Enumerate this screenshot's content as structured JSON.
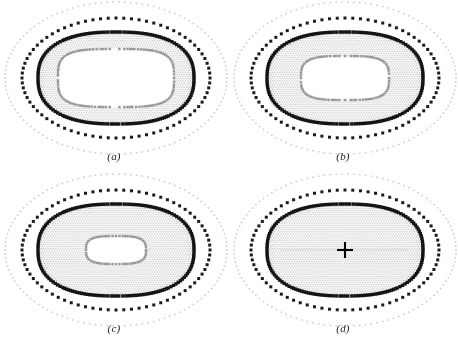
{
  "figure": {
    "type": "mesh-diagram",
    "background_color": "#ffffff",
    "width": 458,
    "height": 345
  },
  "style": {
    "boundary_node_color": "#141414",
    "interior_mesh_color": "#9a9a9a",
    "interior_mesh_light_color": "#c8c8c8",
    "outer_ring_color": "#c9c9c9",
    "mid_ring_color": "#1b1b1b",
    "marker_color": "#000000",
    "label_color": "#1c1c1c",
    "boundary_node_size": 1.7,
    "mid_ring_dot_size": 1.5,
    "outer_ring_dot_size": 0.75
  },
  "panels": [
    {
      "id": "panel-a",
      "label": "(a)",
      "label_x": 94,
      "label_y": 150,
      "center_x": 116,
      "center_y": 78,
      "outer_ring": {
        "rx": 111,
        "ry": 76,
        "count": 118
      },
      "mid_ring": {
        "rx": 94,
        "ry": 60,
        "count": 76
      },
      "mesh_outer": {
        "rx": 78,
        "ry": 46,
        "squareness": 2.45
      },
      "mesh_inner": {
        "rx": 58,
        "ry": 29,
        "squareness": 3.6
      },
      "filled": false,
      "has_center_marker": false,
      "mesh_spacing": 2.45
    },
    {
      "id": "panel-b",
      "label": "(b)",
      "label_x": 323,
      "label_y": 150,
      "center_x": 345,
      "center_y": 78,
      "outer_ring": {
        "rx": 111,
        "ry": 76,
        "count": 118
      },
      "mid_ring": {
        "rx": 94,
        "ry": 60,
        "count": 76
      },
      "mesh_outer": {
        "rx": 78,
        "ry": 46,
        "squareness": 2.45
      },
      "mesh_inner": {
        "rx": 44,
        "ry": 22,
        "squareness": 3.4
      },
      "filled": false,
      "has_center_marker": false,
      "mesh_spacing": 2.45
    },
    {
      "id": "panel-c",
      "label": "(c)",
      "label_x": 94,
      "label_y": 322,
      "center_x": 116,
      "center_y": 250,
      "outer_ring": {
        "rx": 111,
        "ry": 76,
        "count": 118
      },
      "mid_ring": {
        "rx": 94,
        "ry": 60,
        "count": 76
      },
      "mesh_outer": {
        "rx": 78,
        "ry": 46,
        "squareness": 2.45
      },
      "mesh_inner": {
        "rx": 30,
        "ry": 14,
        "squareness": 3.2
      },
      "filled": false,
      "has_center_marker": false,
      "mesh_spacing": 2.45
    },
    {
      "id": "panel-d",
      "label": "(d)",
      "label_x": 323,
      "label_y": 322,
      "center_x": 345,
      "center_y": 250,
      "outer_ring": {
        "rx": 111,
        "ry": 76,
        "count": 118
      },
      "mid_ring": {
        "rx": 94,
        "ry": 60,
        "count": 76
      },
      "mesh_outer": {
        "rx": 78,
        "ry": 46,
        "squareness": 2.45
      },
      "mesh_inner": null,
      "filled": true,
      "has_center_marker": true,
      "center_marker": {
        "type": "plus",
        "arm": 8,
        "thickness": 2.1
      },
      "mesh_spacing": 2.45
    }
  ]
}
